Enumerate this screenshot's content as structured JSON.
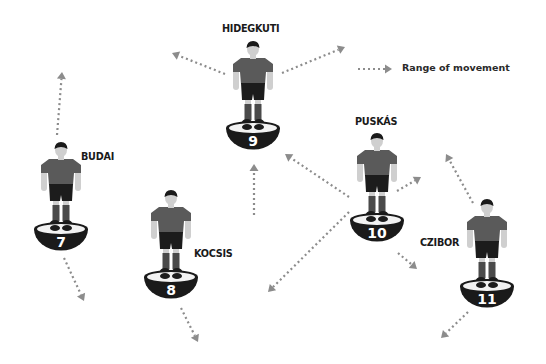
{
  "legend": {
    "label": "Range of movement",
    "arrow": {
      "x1": 358,
      "y1": 69,
      "x2": 392,
      "y2": 69
    }
  },
  "colors": {
    "arrow": "#8c8c8c",
    "shirt": "#5a5a5a",
    "shorts": "#1c1c1c",
    "socks": "#4a4a4a",
    "skin": "#cfcfcf",
    "hair": "#1a1a1a",
    "base": "#1a1a1a",
    "base_top": "#f2f2f2",
    "text": "#1a1a1a"
  },
  "players": [
    {
      "name": "HIDEGKUTI",
      "number": "9",
      "cx": 253,
      "base_y": 128,
      "label_x": 222,
      "label_y": 22
    },
    {
      "name": "BUDAI",
      "number": "7",
      "cx": 61,
      "base_y": 229,
      "label_x": 81,
      "label_y": 150
    },
    {
      "name": "KOCSIS",
      "number": "8",
      "cx": 171,
      "base_y": 277,
      "label_x": 194,
      "label_y": 247
    },
    {
      "name": "PUSKÁS",
      "number": "10",
      "cx": 377,
      "base_y": 220,
      "label_x": 355,
      "label_y": 115
    },
    {
      "name": "CZIBOR",
      "number": "11",
      "cx": 487,
      "base_y": 286,
      "label_x": 420,
      "label_y": 236
    }
  ],
  "arrows": [
    {
      "from": "HIDEGKUTI",
      "x1": 225,
      "y1": 74,
      "x2": 172,
      "y2": 53
    },
    {
      "from": "HIDEGKUTI",
      "x1": 282,
      "y1": 73,
      "x2": 345,
      "y2": 47
    },
    {
      "from": "BUDAI",
      "x1": 57,
      "y1": 135,
      "x2": 62,
      "y2": 72
    },
    {
      "from": "BUDAI",
      "x1": 64,
      "y1": 258,
      "x2": 84,
      "y2": 301
    },
    {
      "from": "KOCSIS",
      "x1": 181,
      "y1": 308,
      "x2": 198,
      "y2": 342
    },
    {
      "from": "KOCSIS",
      "x1": 254,
      "y1": 215,
      "x2": 254,
      "y2": 164
    },
    {
      "from": "PUSKÁS",
      "x1": 349,
      "y1": 197,
      "x2": 285,
      "y2": 154
    },
    {
      "from": "PUSKÁS",
      "x1": 397,
      "y1": 191,
      "x2": 421,
      "y2": 177
    },
    {
      "from": "PUSKÁS",
      "x1": 398,
      "y1": 253,
      "x2": 417,
      "y2": 269
    },
    {
      "from": "PUSKÁS",
      "x1": 349,
      "y1": 212,
      "x2": 268,
      "y2": 292
    },
    {
      "from": "CZIBOR",
      "x1": 473,
      "y1": 203,
      "x2": 446,
      "y2": 154
    },
    {
      "from": "CZIBOR",
      "x1": 468,
      "y1": 312,
      "x2": 441,
      "y2": 338
    }
  ]
}
